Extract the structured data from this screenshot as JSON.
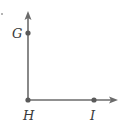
{
  "figure": {
    "vertex": {
      "label": "H"
    },
    "points": [
      {
        "id": "G",
        "label": "G"
      },
      {
        "id": "H",
        "label": "H"
      },
      {
        "id": "I",
        "label": "I"
      }
    ],
    "rays": [
      {
        "from": "H",
        "through": "G",
        "direction": "up"
      },
      {
        "from": "H",
        "through": "I",
        "direction": "right"
      }
    ],
    "colors": {
      "stroke": "#6b6b6b",
      "point": "#5a5a5a",
      "label": "#3a3a3a"
    }
  }
}
